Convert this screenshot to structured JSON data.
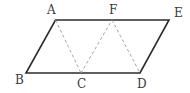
{
  "diagram": {
    "type": "geometry",
    "points": {
      "A": {
        "x": 55.5,
        "y": 20,
        "label": "A",
        "label_x": 47,
        "label_y": 14
      },
      "F": {
        "x": 112,
        "y": 20,
        "label": "F",
        "label_x": 109,
        "label_y": 14
      },
      "E": {
        "x": 169,
        "y": 20,
        "label": "E",
        "label_x": 174,
        "label_y": 17
      },
      "B": {
        "x": 26,
        "y": 73,
        "label": "B",
        "label_x": 15,
        "label_y": 84
      },
      "C": {
        "x": 81,
        "y": 73,
        "label": "C",
        "label_x": 77,
        "label_y": 88
      },
      "D": {
        "x": 140,
        "y": 73,
        "label": "D",
        "label_x": 137,
        "label_y": 88
      }
    },
    "solid_segments": [
      [
        "A",
        "E"
      ],
      [
        "E",
        "D"
      ],
      [
        "D",
        "B"
      ],
      [
        "B",
        "A"
      ]
    ],
    "dashed_segments": [
      [
        "A",
        "C"
      ],
      [
        "C",
        "F"
      ],
      [
        "F",
        "D"
      ]
    ],
    "colors": {
      "solid": "#2b2b2b",
      "dashed": "#9a9a9a",
      "label": "#3a3a3a"
    }
  }
}
